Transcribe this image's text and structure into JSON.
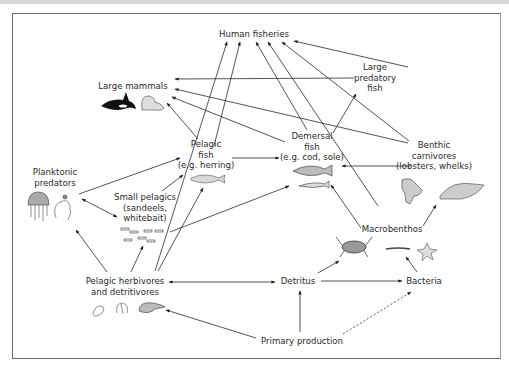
{
  "diagram": {
    "type": "food-web",
    "nodes": {
      "human_fisheries": {
        "lines": [
          "Human fisheries"
        ]
      },
      "large_mammals": {
        "lines": [
          "Large mammals"
        ]
      },
      "large_predatory_fish": {
        "lines": [
          "Large",
          "predatory",
          "fish"
        ]
      },
      "pelagic_fish": {
        "lines": [
          "Pelagic",
          "fish",
          "(e.g. herring)"
        ]
      },
      "demersal_fish": {
        "lines": [
          "Demersal",
          "fish",
          "(e.g. cod, sole)"
        ]
      },
      "benthic_carnivores": {
        "lines": [
          "Benthic",
          "carnivores",
          "(lobsters, whelks)"
        ]
      },
      "planktonic_predators": {
        "lines": [
          "Planktonic",
          "predators"
        ]
      },
      "small_pelagics": {
        "lines": [
          "Small pelagics",
          "(sandeels,",
          "whitebait)"
        ]
      },
      "macrobenthos": {
        "lines": [
          "Macrobenthos"
        ]
      },
      "pelagic_herbivores": {
        "lines": [
          "Pelagic herbivores",
          "and detritivores"
        ]
      },
      "detritus": {
        "lines": [
          "Detritus"
        ]
      },
      "bacteria": {
        "lines": [
          "Bacteria"
        ]
      },
      "primary_production": {
        "lines": [
          "Primary production"
        ]
      }
    },
    "edges": [
      {
        "from": "Large predatory fish",
        "to": "Human fisheries"
      },
      {
        "from": "Benthic carnivores",
        "to": "Human fisheries"
      },
      {
        "from": "Macrobenthos",
        "to": "Human fisheries"
      },
      {
        "from": "Demersal fish",
        "to": "Human fisheries"
      },
      {
        "from": "Pelagic fish",
        "to": "Human fisheries"
      },
      {
        "from": "Pelagic herbivores and detritivores",
        "to": "Human fisheries"
      },
      {
        "from": "Large predatory fish",
        "to": "Large mammals"
      },
      {
        "from": "Benthic carnivores",
        "to": "Large mammals"
      },
      {
        "from": "Demersal fish",
        "to": "Large mammals"
      },
      {
        "from": "Pelagic fish",
        "to": "Large mammals"
      },
      {
        "from": "Demersal fish",
        "to": "Large predatory fish"
      },
      {
        "from": "Pelagic fish",
        "to": "Demersal fish"
      },
      {
        "from": "Benthic carnivores",
        "to": "Demersal fish"
      },
      {
        "from": "Small pelagics",
        "to": "Demersal fish"
      },
      {
        "from": "Macrobenthos",
        "to": "Demersal fish"
      },
      {
        "from": "Planktonic predators",
        "to": "Pelagic fish"
      },
      {
        "from": "Small pelagics",
        "to": "Pelagic fish"
      },
      {
        "from": "Pelagic herbivores and detritivores",
        "to": "Pelagic fish"
      },
      {
        "from": "Planktonic predators",
        "to": "Small pelagics",
        "bidirectional": true
      },
      {
        "from": "Pelagic herbivores and detritivores",
        "to": "Planktonic predators"
      },
      {
        "from": "Pelagic herbivores and detritivores",
        "to": "Small pelagics"
      },
      {
        "from": "Pelagic herbivores and detritivores",
        "to": "Detritus",
        "bidirectional": true
      },
      {
        "from": "Primary production",
        "to": "Pelagic herbivores and detritivores"
      },
      {
        "from": "Primary production",
        "to": "Detritus"
      },
      {
        "from": "Primary production",
        "to": "Bacteria",
        "style": "dashed"
      },
      {
        "from": "Detritus",
        "to": "Bacteria"
      },
      {
        "from": "Detritus",
        "to": "Macrobenthos"
      },
      {
        "from": "Bacteria",
        "to": "Macrobenthos"
      },
      {
        "from": "Macrobenthos",
        "to": "Benthic carnivores"
      }
    ],
    "icons": [
      "orca-icon",
      "seal-icon",
      "herring-icon",
      "cod-icon",
      "sole-icon",
      "lobster-icon",
      "whelk-icon",
      "jellyfish-icon",
      "ctenophore-icon",
      "sandeel-school-icon",
      "crab-icon",
      "worm-icon",
      "starfish-icon",
      "copepod-icon",
      "amphipod-icon",
      "shrimp-icon"
    ]
  }
}
